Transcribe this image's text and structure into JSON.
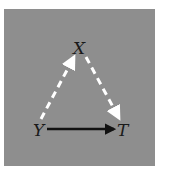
{
  "diagram": {
    "nodes": [
      {
        "id": "X",
        "label": "X",
        "x": 79,
        "y": 52
      },
      {
        "id": "Y",
        "label": "Y",
        "x": 39,
        "y": 136
      },
      {
        "id": "T",
        "label": "T",
        "x": 123,
        "y": 136
      }
    ],
    "edges": [
      {
        "from": "Y",
        "to": "X",
        "style": "dashed",
        "color": "#ffffff"
      },
      {
        "from": "X",
        "to": "T",
        "style": "dashed",
        "color": "#ffffff"
      },
      {
        "from": "Y",
        "to": "T",
        "style": "solid",
        "color": "#111111"
      }
    ],
    "background": "#8e8e8e"
  }
}
